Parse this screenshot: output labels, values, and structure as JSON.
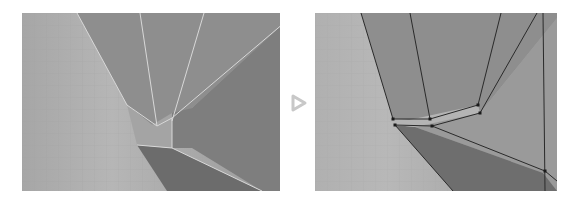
{
  "figure": {
    "panels": [
      {
        "id": "before",
        "label": ""
      },
      {
        "id": "after",
        "label": ""
      }
    ],
    "arrow_icon": "play-outline-arrow"
  },
  "colors": {
    "background": "#ffffff",
    "viewport_light": "#b4b4b4",
    "viewport_mid": "#9a9a9a",
    "face_dark": "#7e7e7e",
    "face_darker": "#6c6c6c",
    "grid": "#a8a8a8",
    "edge_before": "#d8d8d8",
    "edge_after": "#2a2a2a",
    "vertex": "#1a1a1a",
    "arrow": "#c8c8c8"
  }
}
